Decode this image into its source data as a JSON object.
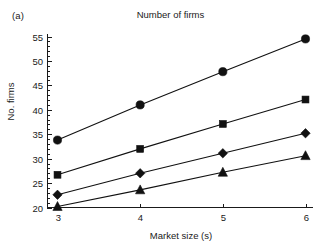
{
  "figure": {
    "panel_label": "(a)",
    "title": "Number of firms"
  },
  "chart_data": {
    "type": "line",
    "title": "Number of firms",
    "xlabel": "Market size (s)",
    "ylabel": "No. firms",
    "x": [
      3,
      4,
      5,
      6
    ],
    "xticklabels": [
      "3",
      "4",
      "5",
      "6"
    ],
    "yticklabels": [
      "20",
      "25",
      "30",
      "35",
      "40",
      "45",
      "50",
      "55"
    ],
    "yticks": [
      20,
      25,
      30,
      35,
      40,
      45,
      50,
      55
    ],
    "xlim": [
      2.75,
      6.2
    ],
    "ylim": [
      19.3,
      56.2
    ],
    "grid": false,
    "legend": "none",
    "minor_ticks_y": true,
    "minor_tick_step_y": 1,
    "series": [
      {
        "name": "circle-series",
        "marker": "circle",
        "color": "#111111",
        "values": [
          33.8,
          41.0,
          47.8,
          54.5
        ]
      },
      {
        "name": "square-series",
        "marker": "square",
        "color": "#111111",
        "values": [
          26.7,
          32.0,
          37.1,
          42.1
        ]
      },
      {
        "name": "diamond-series",
        "marker": "diamond",
        "color": "#111111",
        "values": [
          22.6,
          27.0,
          31.1,
          35.2
        ]
      },
      {
        "name": "triangle-series",
        "marker": "triangle",
        "color": "#111111",
        "values": [
          20.2,
          23.6,
          27.2,
          30.6
        ]
      }
    ]
  }
}
